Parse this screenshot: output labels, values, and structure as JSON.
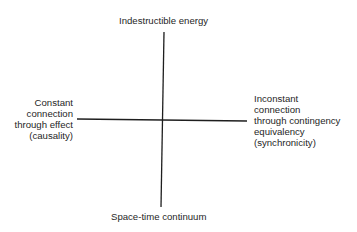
{
  "diagram": {
    "type": "quadrant-axes",
    "colors": {
      "background": "#ffffff",
      "line": "#1e1e1e",
      "text": "#262626"
    },
    "axes": {
      "vertical": {
        "top_label": "Indestructible energy",
        "bottom_label": "Space-time continuum"
      },
      "horizontal": {
        "left_label_lines": [
          "Constant",
          "connection",
          "through effect",
          "(causality)"
        ],
        "right_label_lines": [
          "Inconstant",
          "connection",
          "through contingency",
          "equivalency",
          "(synchronicity)"
        ]
      }
    }
  }
}
